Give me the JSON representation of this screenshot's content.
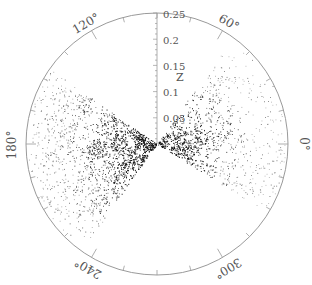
{
  "chart_data": {
    "type": "scatter",
    "subtype": "polar-wedge (redshift cone diagram)",
    "title": "",
    "radial_axis": {
      "label": "Z",
      "ticks": [
        0.05,
        0.1,
        0.15,
        0.2,
        0.25
      ],
      "tick_labels": [
        "0.05",
        "0.1",
        "0.15",
        "0.2",
        "0.25"
      ],
      "range": [
        0,
        0.25
      ]
    },
    "angular_axis": {
      "tick_labels": [
        "60°",
        "120°",
        "180°",
        "240°",
        "300°",
        "0°"
      ],
      "tick_angles_deg": [
        60,
        120,
        180,
        240,
        300,
        0
      ],
      "minor_tick_step_deg": 15
    },
    "wedges": [
      {
        "name": "left-slice",
        "angle_start_deg": 145,
        "angle_end_deg": 235,
        "density": "high"
      },
      {
        "name": "right-slice",
        "angle_start_deg": -32,
        "angle_end_deg": 55,
        "density": "medium"
      }
    ],
    "point_color": "#111111",
    "frame_color": "#999999"
  },
  "labels": {
    "z_axis": "Z",
    "tick_025": "0.25",
    "tick_02": "0.2",
    "tick_015": "0.15",
    "tick_01": "0.1",
    "tick_005": "0.05",
    "angle_60": "60°",
    "angle_120": "120°",
    "angle_180": "180°",
    "angle_240": "240°",
    "angle_300": "300°",
    "angle_0": "0°"
  }
}
